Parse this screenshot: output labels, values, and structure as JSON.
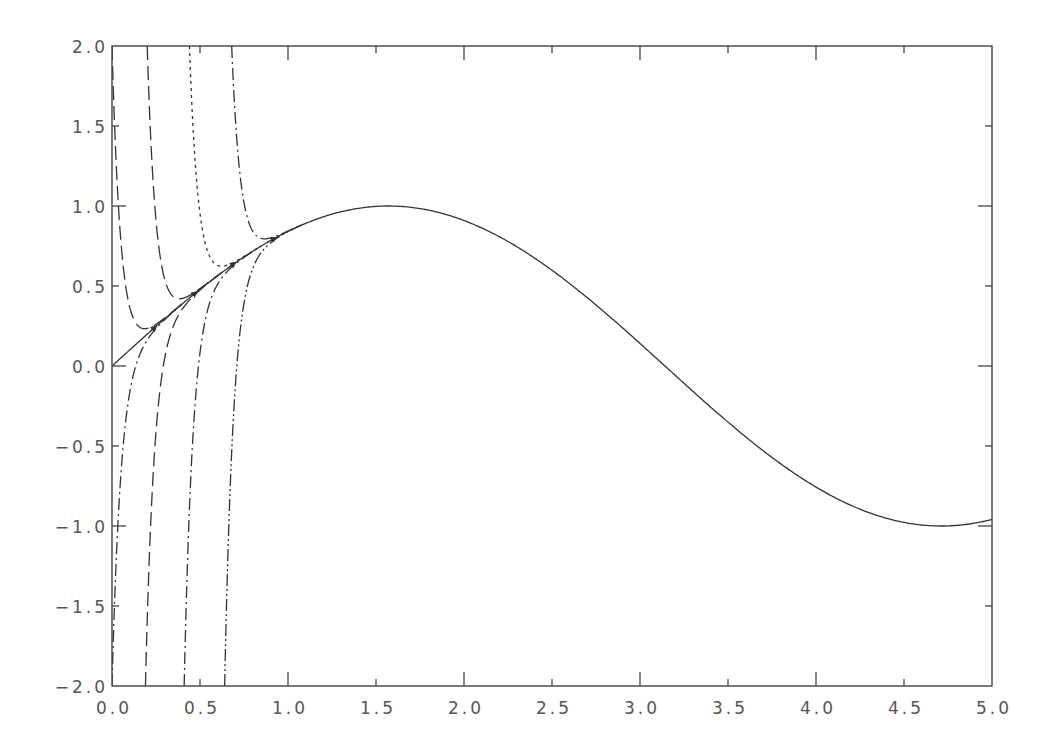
{
  "chart_data": {
    "type": "line",
    "title": "",
    "xlabel": "",
    "ylabel": "",
    "xlim": [
      0.0,
      5.0
    ],
    "ylim": [
      -2.0,
      2.0
    ],
    "grid": false,
    "legend": "none",
    "x_ticks": [
      "0.0",
      "0.5",
      "1.0",
      "1.5",
      "2.0",
      "2.5",
      "3.0",
      "3.5",
      "4.0",
      "4.5",
      "5.0"
    ],
    "y_ticks": [
      "-2.0",
      "-1.5",
      "-1.0",
      "-0.5",
      "0.0",
      "0.5",
      "1.0",
      "1.5",
      "2.0"
    ],
    "series": [
      {
        "name": "sin(x) (solid)",
        "style": "solid",
        "function": "sin(x)",
        "x_range": [
          0,
          5
        ],
        "x": [
          0.0,
          0.5,
          1.0,
          1.5,
          1.57,
          2.0,
          2.5,
          3.0,
          3.5,
          4.0,
          4.5,
          4.71,
          5.0
        ],
        "y": [
          0.0,
          0.479,
          0.841,
          0.997,
          1.0,
          0.909,
          0.598,
          0.141,
          -0.351,
          -0.757,
          -0.978,
          -1.0,
          -0.959
        ]
      },
      {
        "name": "transient from above, x0=0.0",
        "style": "long-dash",
        "x0": 0.0,
        "y0": 2.0,
        "merges_at_x": 0.25
      },
      {
        "name": "transient from above, x0=0.2",
        "style": "long-dash",
        "x0": 0.2,
        "y0": 2.0,
        "merges_at_x": 0.48
      },
      {
        "name": "transient from above, x0=0.44",
        "style": "dotted",
        "x0": 0.44,
        "y0": 2.0,
        "merges_at_x": 0.7
      },
      {
        "name": "transient from above, x0=0.68",
        "style": "dash-dot",
        "x0": 0.68,
        "y0": 2.0,
        "merges_at_x": 0.93
      },
      {
        "name": "transient from below, x0=0.0",
        "style": "dash-dot",
        "x0": 0.0,
        "y0": -2.0,
        "merges_at_x": 0.25
      },
      {
        "name": "transient from below, x0=0.19",
        "style": "long-dash",
        "x0": 0.19,
        "y0": -2.0,
        "merges_at_x": 0.48
      },
      {
        "name": "transient from below, x0=0.41",
        "style": "dash-dot",
        "x0": 0.41,
        "y0": -2.0,
        "merges_at_x": 0.7
      },
      {
        "name": "transient from below, x0=0.64",
        "style": "dash-dot-dot",
        "x0": 0.64,
        "y0": -2.0,
        "merges_at_x": 0.93
      }
    ],
    "annotations": [
      "small arrowheads along sin(x) near x=0.25, 0.48, 0.70, 0.93"
    ]
  },
  "render": {
    "plot_box": {
      "left": 112,
      "top": 46,
      "right": 992,
      "bottom": 686
    },
    "decay_rate": 20,
    "colors": {
      "line": "#333333",
      "frame": "#444444",
      "text": "#555555",
      "background": "#ffffff"
    },
    "dash_patterns": {
      "solid": "",
      "long-dash": "14 6",
      "dotted": "3 4",
      "dash-dot": "12 4 2 4",
      "dash-dot-dot": "12 3 2 3 2 3"
    }
  }
}
